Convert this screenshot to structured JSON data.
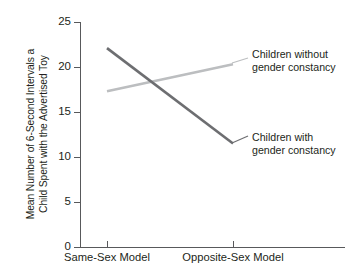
{
  "chart_data": {
    "type": "line",
    "title": "",
    "xlabel": "",
    "ylabel": "Mean Number of 6-Second Intervals a Child Spent with the Advertised Toy",
    "ylabel_lines": [
      "Mean Number of 6-Second Intervals a",
      "Child Spent with the Advertised Toy"
    ],
    "categories": [
      "Same-Sex Model",
      "Opposite-Sex Model"
    ],
    "ylim": [
      0,
      25
    ],
    "yticks": [
      0,
      5,
      10,
      15,
      20,
      25
    ],
    "ytick_labels": [
      "0",
      "5",
      "10",
      "15",
      "20",
      "25"
    ],
    "grid": false,
    "legend_position": "inline-right",
    "series": [
      {
        "name": "Children with gender constancy",
        "values": [
          22.1,
          11.5
        ],
        "color": "#6d6e71",
        "width": 2.6,
        "label_lines": [
          "Children with",
          "gender constancy"
        ]
      },
      {
        "name": "Children without gender constancy",
        "values": [
          17.3,
          20.3
        ],
        "color": "#bcbec0",
        "width": 2.6,
        "label_lines": [
          "Children without",
          "gender constancy"
        ]
      }
    ],
    "annotations": [
      {
        "text": "Children without gender constancy",
        "lines": [
          "Children without",
          "gender constancy"
        ],
        "attached_series": "Children without gender constancy"
      },
      {
        "text": "Children with gender constancy",
        "lines": [
          "Children with",
          "gender constancy"
        ],
        "attached_series": "Children with gender constancy"
      }
    ],
    "leader_lines": [
      {
        "name": "leader-without",
        "x1": 232,
        "y1": 63,
        "x2": 248,
        "y2": 58
      },
      {
        "name": "leader-with",
        "x1": 232,
        "y1": 143,
        "x2": 248,
        "y2": 136
      }
    ],
    "axis_color": "#58595b",
    "text_color": "#231f20",
    "background": "#ffffff"
  }
}
